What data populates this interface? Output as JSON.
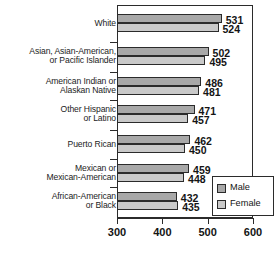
{
  "chart_data": {
    "type": "bar",
    "orientation": "horizontal",
    "title": "",
    "xlabel": "",
    "ylabel": "",
    "xlim": [
      300,
      600
    ],
    "xticks": [
      300,
      400,
      500,
      600
    ],
    "grid": false,
    "legend_position": "bottom-right",
    "categories": [
      "White",
      "Asian, Asian-American, or Pacific Islander",
      "American Indian or Alaskan Native",
      "Other Hispanic or Latino",
      "Puerto Rican",
      "Mexican or Mexican-American",
      "African-American or Black"
    ],
    "series": [
      {
        "name": "Male",
        "values": [
          531,
          502,
          486,
          471,
          462,
          459,
          432
        ]
      },
      {
        "name": "Female",
        "values": [
          524,
          495,
          481,
          457,
          450,
          448,
          435
        ]
      }
    ]
  },
  "category_label_lines": [
    [
      "White"
    ],
    [
      "Asian, Asian-American,",
      "or Pacific Islander"
    ],
    [
      "American Indian or",
      "Alaskan Native"
    ],
    [
      "Other Hispanic",
      "or Latino"
    ],
    [
      "Puerto Rican"
    ],
    [
      "Mexican or",
      "Mexican-American"
    ],
    [
      "African-American",
      "or Black"
    ]
  ],
  "value_labels": {
    "male": [
      "531",
      "502",
      "486",
      "471",
      "462",
      "459",
      "432"
    ],
    "female": [
      "524",
      "495",
      "481",
      "457",
      "450",
      "448",
      "435"
    ]
  },
  "axis": {
    "tick_labels": [
      "300",
      "400",
      "500",
      "600"
    ]
  },
  "legend": {
    "entries": [
      {
        "label": "Male",
        "swatch": "male-swatch-icon"
      },
      {
        "label": "Female",
        "swatch": "female-swatch-icon"
      }
    ]
  },
  "colors": {
    "male_fill": "#a8a8a8",
    "female_fill": "#c9c9c9",
    "outline": "#2b2b2b",
    "text": "#141414",
    "background": "#ffffff"
  }
}
